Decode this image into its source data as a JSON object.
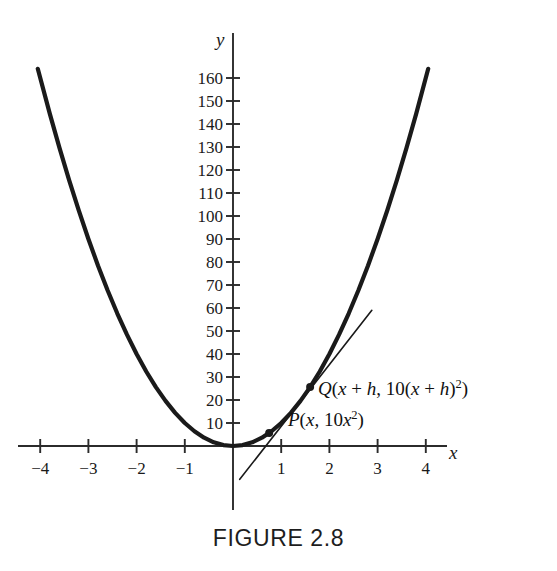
{
  "figure": {
    "caption": "FIGURE 2.8",
    "caption_y": 527
  },
  "axes": {
    "x_axis_name": "x",
    "y_axis_name": "y",
    "origin_px": {
      "x": 233,
      "y": 446
    },
    "x_scale_px_per_unit": 48.2,
    "y_scale_px_per_unit": 2.3,
    "x_ticks": [
      {
        "label": "−4",
        "value": -4
      },
      {
        "label": "−3",
        "value": -3
      },
      {
        "label": "−2",
        "value": -2
      },
      {
        "label": "−1",
        "value": -1
      },
      {
        "label": "1",
        "value": 1
      },
      {
        "label": "2",
        "value": 2
      },
      {
        "label": "3",
        "value": 3
      },
      {
        "label": "4",
        "value": 4
      }
    ],
    "y_ticks": [
      {
        "label": "160",
        "value": 160
      },
      {
        "label": "150",
        "value": 150
      },
      {
        "label": "140",
        "value": 140
      },
      {
        "label": "130",
        "value": 130
      },
      {
        "label": "120",
        "value": 120
      },
      {
        "label": "110",
        "value": 110
      },
      {
        "label": "100",
        "value": 100
      },
      {
        "label": "90",
        "value": 90
      },
      {
        "label": "80",
        "value": 80
      },
      {
        "label": "70",
        "value": 70
      },
      {
        "label": "60",
        "value": 60
      },
      {
        "label": "50",
        "value": 50
      },
      {
        "label": "40",
        "value": 40
      },
      {
        "label": "30",
        "value": 30
      },
      {
        "label": "20",
        "value": 20
      },
      {
        "label": "10",
        "value": 10
      }
    ]
  },
  "labels": {
    "point_q": {
      "prefix": "Q",
      "full_text": "Q(x + h, 10(x + h)²)",
      "x_px": 318,
      "y_px": 379
    },
    "point_p": {
      "prefix": "P",
      "full_text": "P(x, 10x²)",
      "x_px": 288,
      "y_px": 410
    }
  },
  "chart_data": {
    "type": "line",
    "title": "FIGURE 2.8",
    "xlabel": "x",
    "ylabel": "y",
    "xlim": [
      -4.3,
      4.6
    ],
    "ylim": [
      -22,
      172
    ],
    "grid": false,
    "legend": "none",
    "series": [
      {
        "name": "parabola",
        "equation": "y = 10x^2",
        "stroke_width": 4.2,
        "color": "#1a1a1a",
        "x": [
          -4.05,
          -3.8,
          -3.6,
          -3.4,
          -3.2,
          -3.0,
          -2.8,
          -2.6,
          -2.4,
          -2.2,
          -2.0,
          -1.8,
          -1.6,
          -1.4,
          -1.2,
          -1.0,
          -0.8,
          -0.6,
          -0.4,
          -0.2,
          0.0,
          0.2,
          0.4,
          0.6,
          0.8,
          1.0,
          1.2,
          1.4,
          1.6,
          1.8,
          2.0,
          2.2,
          2.4,
          2.6,
          2.8,
          3.0,
          3.2,
          3.4,
          3.6,
          3.8,
          4.05
        ],
        "y": [
          164.0,
          144.4,
          129.6,
          115.6,
          102.4,
          90.0,
          78.4,
          67.6,
          57.6,
          48.4,
          40.0,
          32.4,
          25.6,
          19.6,
          14.4,
          10.0,
          6.4,
          3.6,
          1.6,
          0.4,
          0.0,
          0.4,
          1.6,
          3.6,
          6.4,
          10.0,
          14.4,
          19.6,
          25.6,
          32.4,
          40.0,
          48.4,
          57.6,
          67.6,
          78.4,
          90.0,
          102.4,
          115.6,
          129.6,
          144.4,
          164.0
        ]
      },
      {
        "name": "secant-line-PQ",
        "equation": "secant through P and Q",
        "stroke_width": 1.6,
        "color": "#1a1a1a",
        "x": [
          0.14,
          2.88
        ],
        "y": [
          -14.5,
          59.0
        ]
      }
    ],
    "points": [
      {
        "name": "P",
        "x": 0.75,
        "y": 5.6,
        "label": "P(x, 10x²)"
      },
      {
        "name": "Q",
        "x": 1.6,
        "y": 25.6,
        "label": "Q(x + h, 10(x + h)²)"
      }
    ]
  },
  "colors": {
    "curve": "#1a1a1a",
    "axis": "#2b2b2b",
    "text": "#1a1a1a",
    "background": "#ffffff"
  }
}
